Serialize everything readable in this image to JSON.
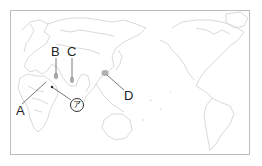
{
  "map": {
    "type": "world outline map (Pacific-centered)",
    "labels": {
      "A": "A",
      "B": "B",
      "C": "C",
      "D": "D",
      "a_mark": "ア"
    },
    "colors": {
      "land_outline": "#c8c8c8",
      "frame": "#bdbdbd",
      "leader_line": "#555555",
      "highlight": "#9a9a9a"
    }
  }
}
